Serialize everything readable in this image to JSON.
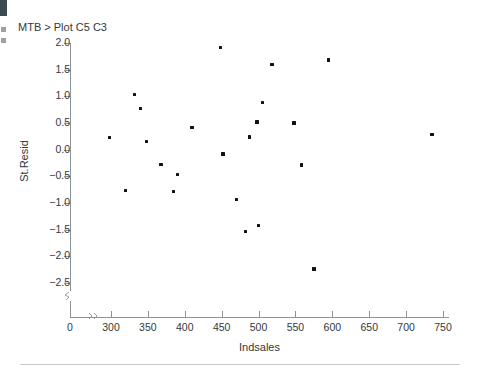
{
  "command_line": "MTB > Plot C5 C3",
  "bottom_rule": true,
  "chart_data": {
    "type": "scatter",
    "title": "MTB > Plot C5 C3",
    "xlabel": "Indsales",
    "ylabel": "St.Resid",
    "xlim": [
      270,
      760
    ],
    "ylim": [
      -2.75,
      2.1
    ],
    "x_ticks": [
      0,
      300,
      350,
      400,
      450,
      500,
      550,
      600,
      650,
      700,
      750
    ],
    "y_ticks": [
      2.0,
      1.5,
      1.0,
      0.5,
      0.0,
      -0.5,
      -1.0,
      -1.5,
      -2.0,
      -2.5
    ],
    "x_tick_labels": [
      "0",
      "300",
      "350",
      "400",
      "450",
      "500",
      "550",
      "600",
      "650",
      "700",
      "750"
    ],
    "y_tick_labels": [
      "2.0",
      "1.5",
      "1.0",
      "0.5",
      "0.0",
      "-0.5",
      "-1.0",
      "-1.5",
      "-2.0",
      "-2.5"
    ],
    "axis_break_x": true,
    "axis_break_y": true,
    "grid": false,
    "legend": null,
    "points": [
      {
        "x": 298,
        "y": 0.23
      },
      {
        "x": 320,
        "y": -0.77
      },
      {
        "x": 332,
        "y": 1.04
      },
      {
        "x": 340,
        "y": 0.77
      },
      {
        "x": 348,
        "y": 0.15
      },
      {
        "x": 368,
        "y": -0.28
      },
      {
        "x": 385,
        "y": -0.78
      },
      {
        "x": 390,
        "y": -0.47
      },
      {
        "x": 410,
        "y": 0.42
      },
      {
        "x": 448,
        "y": 1.92
      },
      {
        "x": 452,
        "y": -0.08
      },
      {
        "x": 470,
        "y": -0.93
      },
      {
        "x": 482,
        "y": -1.53
      },
      {
        "x": 488,
        "y": 0.24
      },
      {
        "x": 498,
        "y": 0.52
      },
      {
        "x": 500,
        "y": -1.42
      },
      {
        "x": 505,
        "y": 0.88
      },
      {
        "x": 518,
        "y": 1.6
      },
      {
        "x": 548,
        "y": 0.5
      },
      {
        "x": 558,
        "y": -0.29
      },
      {
        "x": 575,
        "y": -2.24
      },
      {
        "x": 595,
        "y": 1.68
      },
      {
        "x": 735,
        "y": 0.28
      }
    ]
  }
}
